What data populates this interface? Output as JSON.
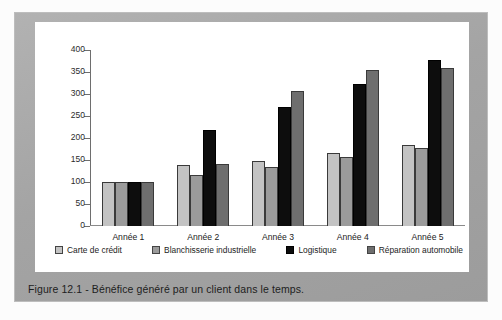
{
  "figure": {
    "caption": "Figure 12.1 - Bénéfice généré par un client dans le temps.",
    "frame_color": "#a9a9a9",
    "card_color": "#ffffff"
  },
  "chart_data": {
    "type": "bar",
    "title": "",
    "subtitle": "",
    "xlabel": "",
    "ylabel": "",
    "categories": [
      "Année 1",
      "Année 2",
      "Année 3",
      "Année 4",
      "Année 5"
    ],
    "series": [
      {
        "name": "Carte de crédit",
        "color": "#c3c3c3",
        "values": [
          100,
          138,
          147,
          166,
          183
        ]
      },
      {
        "name": "Blanchisserie industrielle",
        "color": "#9b9b9b",
        "values": [
          100,
          115,
          135,
          157,
          178
        ]
      },
      {
        "name": "Logistique",
        "color": "#0d0d0d",
        "values": [
          100,
          218,
          270,
          322,
          378
        ]
      },
      {
        "name": "Réparation automobile",
        "color": "#6e6e6e",
        "values": [
          100,
          140,
          306,
          354,
          358
        ]
      }
    ],
    "ylim": [
      0,
      400
    ],
    "yticks": [
      0,
      50,
      100,
      150,
      200,
      250,
      300,
      350,
      400
    ],
    "ytick_labels": [
      "0",
      "50",
      "100",
      "150",
      "200",
      "250",
      "300",
      "350",
      "400"
    ],
    "grid": false,
    "legend_position": "bottom"
  }
}
